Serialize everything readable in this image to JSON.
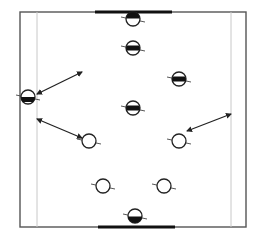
{
  "diagram": {
    "type": "sports-drill-field",
    "colors": {
      "background": "#ffffff",
      "boundary": "#555555",
      "inner_line": "#c8c8c8",
      "goal": "#111111",
      "player_outline": "#222222",
      "player_fill_team_a": "#111111",
      "arrow": "#222222"
    },
    "field": {
      "outer": {
        "x1": 20,
        "y1": 12,
        "x2": 246,
        "y2": 227
      },
      "inner_lines": [
        {
          "x": 37,
          "y1": 12,
          "y2": 227
        },
        {
          "x": 231,
          "y1": 12,
          "y2": 227
        }
      ]
    },
    "goals": [
      {
        "id": "top-goal",
        "x1": 95,
        "x2": 172,
        "y": 12
      },
      {
        "id": "bottom-goal",
        "x1": 98,
        "x2": 175,
        "y": 227
      }
    ],
    "players": [
      {
        "id": "team-a-keeper",
        "team": "band-top",
        "x": 133,
        "y": 19,
        "style": "half-top"
      },
      {
        "id": "team-a-1",
        "team": "band",
        "x": 133,
        "y": 48,
        "style": "band"
      },
      {
        "id": "team-a-2",
        "team": "band",
        "x": 179,
        "y": 79,
        "style": "band"
      },
      {
        "id": "team-a-3",
        "team": "band",
        "x": 133,
        "y": 108,
        "style": "band"
      },
      {
        "id": "team-a-wide",
        "team": "band",
        "x": 28,
        "y": 97,
        "style": "band-low"
      },
      {
        "id": "team-b-1",
        "team": "open",
        "x": 89,
        "y": 141,
        "style": "open"
      },
      {
        "id": "team-b-2",
        "team": "open",
        "x": 179,
        "y": 141,
        "style": "open"
      },
      {
        "id": "team-b-3",
        "team": "open",
        "x": 103,
        "y": 186,
        "style": "open"
      },
      {
        "id": "team-b-4",
        "team": "open",
        "x": 164,
        "y": 186,
        "style": "open"
      },
      {
        "id": "team-b-keeper",
        "team": "open",
        "x": 135,
        "y": 216,
        "style": "half-bottom"
      }
    ],
    "arrows": [
      {
        "id": "arrow-1",
        "x1": 37,
        "y1": 94,
        "x2": 82,
        "y2": 72,
        "double": true
      },
      {
        "id": "arrow-2",
        "x1": 37,
        "y1": 119,
        "x2": 82,
        "y2": 138,
        "double": true
      },
      {
        "id": "arrow-3",
        "x1": 187,
        "y1": 131,
        "x2": 231,
        "y2": 114,
        "double": true
      }
    ]
  }
}
